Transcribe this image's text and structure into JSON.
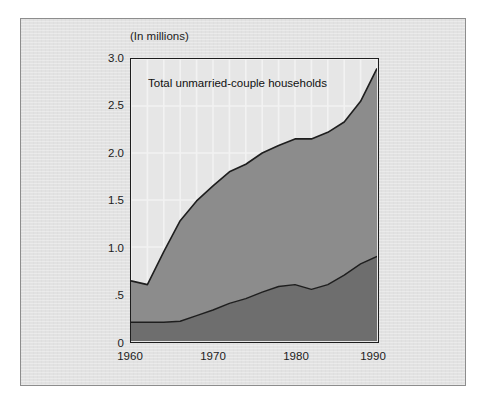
{
  "figure": {
    "units_label": "(In millions)",
    "title": "Total unmarried-couple households"
  },
  "colors": {
    "background": "#e2e2e2",
    "plot_background": "#e6e6e6",
    "upper_band": "#8c8c8c",
    "lower_band": "#6e6e6e",
    "line": "#1e1e1e",
    "gridline": "#f2f2f2",
    "frame": "#1e1e1e",
    "text": "#1c1c1c"
  },
  "axes": {
    "y_ticks": [
      "3.0",
      "2.5",
      "2.0",
      "1.5",
      "1.0",
      ".5",
      "0"
    ],
    "y_tick_values": [
      3.0,
      2.5,
      2.0,
      1.5,
      1.0,
      0.5,
      0
    ],
    "x_ticks": [
      "1960",
      "1970",
      "1980",
      "1990"
    ],
    "x_tick_values": [
      1960,
      1970,
      1980,
      1990
    ]
  },
  "chart_data": {
    "type": "area",
    "title": "Total unmarried-couple households",
    "xlabel": "",
    "ylabel": "(In millions)",
    "xlim": [
      1960,
      1990
    ],
    "ylim": [
      0,
      3.0
    ],
    "grid": true,
    "legend_position": "none",
    "stacked": true,
    "x": [
      1960,
      1962,
      1964,
      1966,
      1968,
      1970,
      1972,
      1974,
      1976,
      1978,
      1980,
      1982,
      1984,
      1986,
      1988,
      1990
    ],
    "series": [
      {
        "name": "lower-band",
        "values": [
          0.2,
          0.2,
          0.2,
          0.21,
          0.27,
          0.33,
          0.4,
          0.45,
          0.52,
          0.58,
          0.6,
          0.55,
          0.6,
          0.7,
          0.82,
          0.9
        ]
      },
      {
        "name": "upper-band",
        "values": [
          0.44,
          0.4,
          0.75,
          1.07,
          1.22,
          1.32,
          1.4,
          1.43,
          1.48,
          1.5,
          1.55,
          1.6,
          1.62,
          1.63,
          1.73,
          2.0
        ]
      }
    ],
    "totals": [
      0.64,
      0.6,
      0.95,
      1.28,
      1.49,
      1.65,
      1.8,
      1.88,
      2.0,
      2.08,
      2.15,
      2.15,
      2.22,
      2.33,
      2.55,
      2.9
    ]
  }
}
